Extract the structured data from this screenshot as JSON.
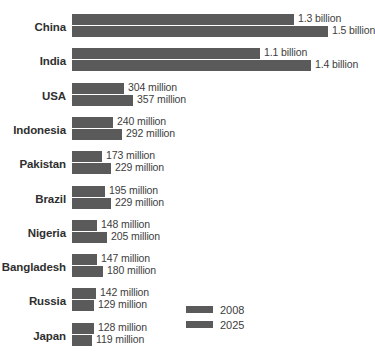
{
  "chart_data": {
    "type": "bar",
    "title": "",
    "subtitle": "",
    "xlabel": "",
    "ylabel": "",
    "orientation": "horizontal",
    "grid": false,
    "legend_position": "bottom-right",
    "xlim": [
      0,
      1500
    ],
    "unit_note": "values in millions; labels shown as billions where >= 1000 million",
    "categories": [
      "China",
      "India",
      "USA",
      "Indonesia",
      "Pakistan",
      "Brazil",
      "Nigeria",
      "Bangladesh",
      "Russia",
      "Japan"
    ],
    "series": [
      {
        "name": "2008",
        "values": [
          1300,
          1100,
          304,
          240,
          173,
          195,
          148,
          147,
          142,
          128
        ],
        "labels": [
          "1.3 billion",
          "1.1 billion",
          "304 million",
          "240 million",
          "173 million",
          "195 million",
          "148 million",
          "147 million",
          "142 million",
          "128 million"
        ]
      },
      {
        "name": "2025",
        "values": [
          1500,
          1400,
          357,
          292,
          229,
          229,
          205,
          180,
          129,
          119
        ],
        "labels": [
          "1.5 billion",
          "1.4 billion",
          "357 million",
          "292 million",
          "229 million",
          "229 million",
          "205 million",
          "180 million",
          "129 million",
          "119 million"
        ]
      }
    ],
    "colors": {
      "bar": "#5a5a5a",
      "background": "#ffffff",
      "text": "#3d3d3d",
      "category_text": "#2f2f2f"
    }
  },
  "legend": {
    "items": [
      {
        "label": "2008"
      },
      {
        "label": "2025"
      }
    ]
  }
}
